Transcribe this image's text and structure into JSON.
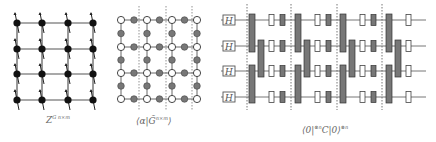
{
  "panels": [
    {
      "id": "ising-grid",
      "label": "Z",
      "label_sup": "G n×m",
      "rows": 4,
      "cols": 4,
      "node_color": "#111111",
      "xs": [
        17,
        42,
        68,
        93
      ],
      "ys": [
        23,
        49,
        74,
        100
      ]
    },
    {
      "id": "tensor-grid",
      "label": "⟨α|G̃",
      "label_sup": "n×m",
      "label_close": "⟩",
      "rows": 4,
      "cols": 4,
      "white_node_color": "#ffffff",
      "gray_node_color": "#777777",
      "xs": [
        121,
        147,
        172,
        197
      ],
      "ys": [
        20,
        47,
        73,
        99
      ],
      "dashed_x": [
        139,
        166,
        192
      ]
    },
    {
      "id": "quantum-circuit",
      "label": "⟨0|",
      "label_sup1": "⊗n",
      "label_mid": "C|0⟩",
      "label_sup2": "⊗n",
      "wires_y": [
        20,
        46,
        71,
        97
      ],
      "hadamard_label": "H",
      "hadamard_x": 229,
      "dashed_x": [
        247,
        291,
        337,
        382
      ],
      "gate_fill": "#777777"
    }
  ]
}
